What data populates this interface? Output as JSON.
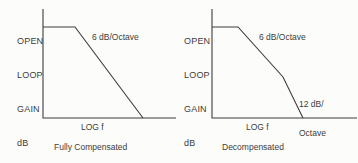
{
  "figure": {
    "colors": {
      "ink": "#3c3c3c",
      "background": "#fcfcfa"
    },
    "panels": [
      {
        "id": "fully-compensated",
        "y_axis_label_lines": [
          "OPEN",
          "LOOP",
          "GAIN",
          "dB"
        ],
        "x_axis_label": "LOG f",
        "caption": "Fully Compensated",
        "slope_label_1": "6 dB/Octave",
        "axis_points": [
          [
            43,
            9
          ],
          [
            43,
            118
          ],
          [
            176,
            118
          ]
        ],
        "curve_points": [
          [
            43,
            27
          ],
          [
            75,
            27
          ],
          [
            143,
            118
          ]
        ]
      },
      {
        "id": "decompensated",
        "y_axis_label_lines": [
          "OPEN",
          "LOOP",
          "GAIN",
          "dB"
        ],
        "x_axis_label": "LOG f",
        "caption": "Decompensated",
        "slope_label_1": "6 dB/Octave",
        "slope_label_2_lines": [
          "12 dB/",
          "Octave"
        ],
        "axis_points": [
          [
            33,
            9
          ],
          [
            33,
            118
          ],
          [
            178,
            118
          ]
        ],
        "curve_points": [
          [
            33,
            27
          ],
          [
            59,
            27
          ],
          [
            104,
            77
          ],
          [
            124,
            118
          ]
        ]
      }
    ]
  }
}
